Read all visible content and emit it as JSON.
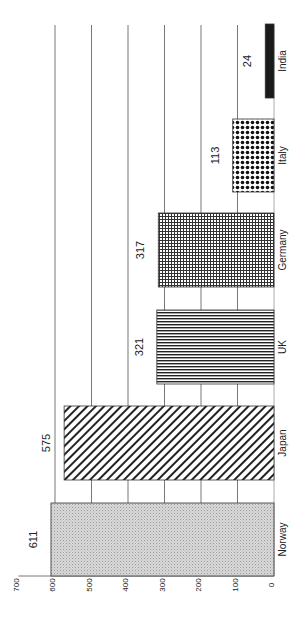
{
  "chart_data": {
    "type": "bar",
    "orientation": "vertical bars, page rotated 90° counter-clockwise",
    "title": "",
    "xlabel": "",
    "ylabel": "",
    "categories": [
      "Norway",
      "Japan",
      "UK",
      "Germany",
      "Italy",
      "India"
    ],
    "values": [
      611,
      575,
      321,
      317,
      113,
      24
    ],
    "value_labels": [
      "611",
      "575",
      "321",
      "317",
      "113",
      "24"
    ],
    "patterns": [
      "fine-dots-light-gray",
      "diagonal-hatch",
      "vertical-lines",
      "grid-crosshatch",
      "checkerboard-dots",
      "solid-black"
    ],
    "ylim": [
      0,
      700
    ],
    "yticks": [
      "0",
      "100",
      "200",
      "300",
      "400",
      "500",
      "600",
      "700"
    ],
    "grid": true,
    "legend": null
  }
}
